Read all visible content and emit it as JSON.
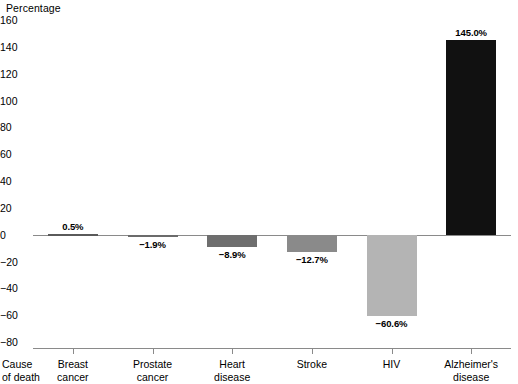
{
  "chart_data": {
    "type": "bar",
    "title": "",
    "ylabel": "Percentage",
    "xlabel": "Cause of death",
    "ylim": [
      -80,
      160
    ],
    "yticks": [
      160,
      140,
      120,
      100,
      80,
      60,
      40,
      20,
      0,
      -20,
      -40,
      -60,
      -80
    ],
    "ytick_labels": [
      "160",
      "140",
      "120",
      "100",
      "80",
      "60",
      "40",
      "20",
      "0",
      "−20",
      "−40",
      "−60",
      "−80"
    ],
    "grid": false,
    "legend": null,
    "categories": [
      "Breast cancer",
      "Prostate cancer",
      "Heart disease",
      "Stroke",
      "HIV",
      "Alzheimer's disease"
    ],
    "category_lines": [
      [
        "Breast",
        "cancer"
      ],
      [
        "Prostate",
        "cancer"
      ],
      [
        "Heart",
        "disease"
      ],
      [
        "Stroke",
        ""
      ],
      [
        "HIV",
        ""
      ],
      [
        "Alzheimer's",
        "disease"
      ]
    ],
    "values": [
      0.5,
      -1.9,
      -8.9,
      -12.7,
      -60.6,
      145.0
    ],
    "data_labels": [
      "0.5%",
      "−1.9%",
      "−8.9%",
      "−12.7%",
      "−60.6%",
      "145.0%"
    ],
    "bar_colors": [
      "#ffffff",
      "#6b6b6b",
      "#6e6e6e",
      "#8a8a8a",
      "#b4b4b4",
      "#111111"
    ]
  },
  "axis": {
    "y_title": "Percentage",
    "x_title_lines": [
      "Cause",
      "of death"
    ]
  }
}
